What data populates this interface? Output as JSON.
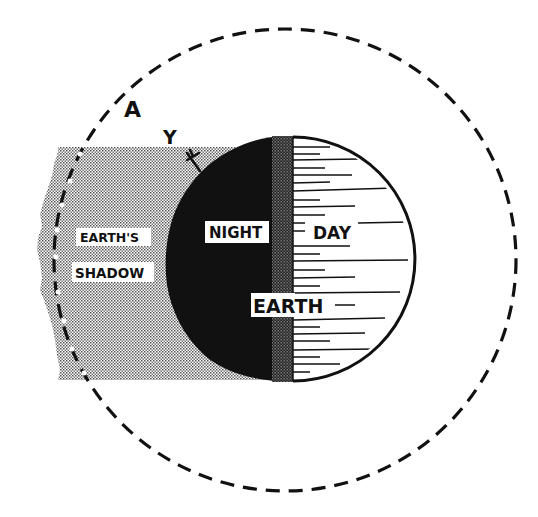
{
  "diagram": {
    "labels": {
      "orbit_point_a": "A",
      "point_y": "Y",
      "point_x": "X",
      "shadow_line1": "EARTH'S",
      "shadow_line2": "SHADOW",
      "night": "NIGHT",
      "day": "DAY",
      "earth": "EARTH"
    },
    "colors": {
      "ink": "#111111",
      "background": "#ffffff",
      "shadow_stipple": "#b8b8b8",
      "terminator_stipple": "#3a3a3a"
    },
    "geometry": {
      "orbit": {
        "cx": 285,
        "cy": 260,
        "r": 231,
        "style": "dashed"
      },
      "earth": {
        "cx": 287,
        "cy": 259,
        "r": 122
      },
      "terminator_x": 293,
      "shadow_rect": {
        "x": 55,
        "y": 147,
        "w": 238,
        "h": 233
      }
    }
  }
}
